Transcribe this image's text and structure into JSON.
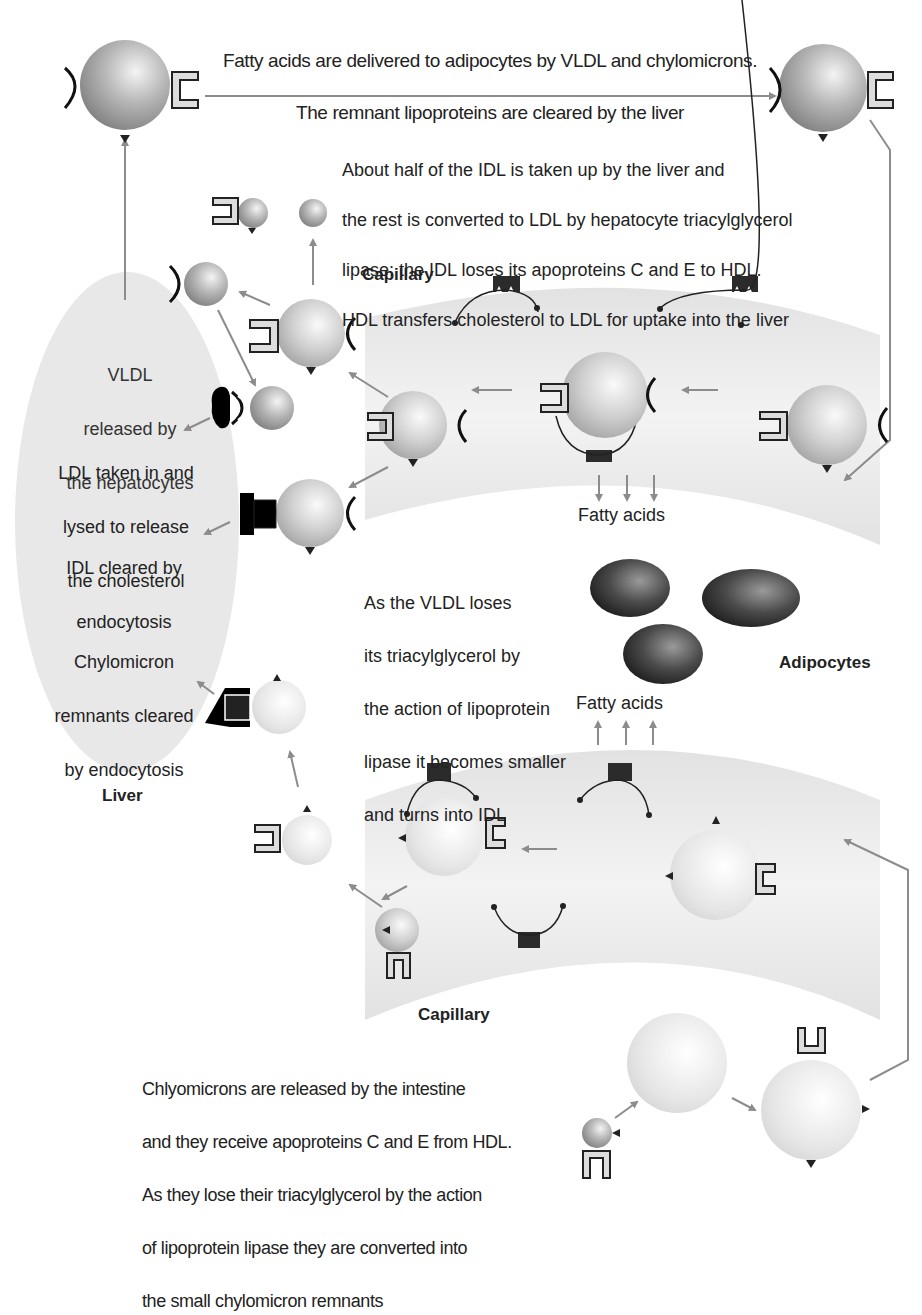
{
  "title_caption": {
    "line1": "Fatty acids are delivered to adipocytes by VLDL and chylomicrons.",
    "line2": "The remnant lipoproteins are cleared by the liver"
  },
  "idl_caption": {
    "line1": "About half of the IDL is taken up by the liver and",
    "line2": "the rest is converted to LDL by hepatocyte triacylglycerol",
    "line3": "lipase; the IDL loses its apoproteins C and E to HDL.",
    "line4": "HDL transfers cholesterol to LDL for uptake into the liver"
  },
  "liver": {
    "label": "Liver",
    "vldl_text": {
      "line1": "VLDL",
      "line2": "released by",
      "line3": "the hepatocytes"
    },
    "ldl_text": {
      "line1": "LDL taken in and",
      "line2": "lysed to release",
      "line3": "the cholesterol"
    },
    "idl_text": {
      "line1": "IDL cleared by",
      "line2": "endocytosis"
    },
    "chylo_text": {
      "line1": "Chylomicron",
      "line2": "remnants cleared",
      "line3": "by endocytosis"
    }
  },
  "capillary_top": {
    "label": "Capillary",
    "fatty_acids_label": "Fatty acids"
  },
  "vldl_caption": {
    "line1": "As the VLDL loses",
    "line2": "its triacylglycerol by",
    "line3": "the action of lipoprotein",
    "line4": "lipase it becomes smaller",
    "line5": "and turns into IDL"
  },
  "adipocytes": {
    "label": "Adipocytes",
    "fatty_acids_label": "Fatty acids"
  },
  "capillary_bottom": {
    "label": "Capillary"
  },
  "chylo_caption": {
    "line1": "Chlyomicrons are released by the intestine",
    "line2": "and they receive apoproteins C and E from HDL.",
    "line3": "As they lose their triacylglycerol by the action",
    "line4": "of lipoprotein lipase they are converted into",
    "line5": "the small chylomicron remnants"
  },
  "colors": {
    "arrow": "#8c8c8c",
    "capillary_fill": "#e6e6e6",
    "liver_fill": "#e8e8e8",
    "enzyme": "#2b2b2b",
    "adipocyte": "#3a3a3a"
  }
}
